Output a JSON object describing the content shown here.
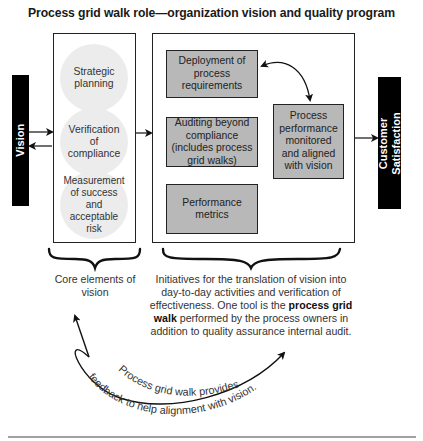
{
  "title": "Process grid walk role—organization vision and quality program",
  "left_bar": {
    "label": "Vision",
    "color": "#000000"
  },
  "right_bar": {
    "label_line1": "Customer",
    "label_line2": "Satisfaction",
    "color": "#000000"
  },
  "core_elements": {
    "items": [
      {
        "label": "Strategic planning"
      },
      {
        "label": "Verification of compliance"
      },
      {
        "label": "Measurement of success and acceptable risk"
      }
    ],
    "caption": "Core elements of vision"
  },
  "initiatives": {
    "boxes": [
      {
        "label": "Deployment of process requirements"
      },
      {
        "label": "Auditing beyond compliance (includes process grid walks)"
      },
      {
        "label": "Performance metrics"
      },
      {
        "label": "Process performance monitored and aligned with vision"
      }
    ],
    "caption_part1": "Initiatives for the translation of vision into day-to-day activities and verification of effectiveness. One tool is the ",
    "caption_bold": "process grid walk",
    "caption_part2": " performed by the process owners in addition to quality assurance internal audit."
  },
  "feedback": {
    "line1": "Process grid walk provides",
    "line2": "feedback to help alignment with vision."
  },
  "colors": {
    "box_fill": "#b8b8b8",
    "circle_fill": "#ececec",
    "stroke": "#222222"
  }
}
